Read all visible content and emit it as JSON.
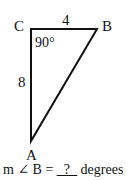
{
  "diagram": {
    "type": "right-triangle",
    "vertices": {
      "A": "A",
      "B": "B",
      "C": "C"
    },
    "side_CB": "4",
    "side_CA": "8",
    "angle_C": "90°"
  },
  "question": {
    "prefix": "m ∠ B = ",
    "blank": "_?_",
    "suffix": " degrees"
  }
}
